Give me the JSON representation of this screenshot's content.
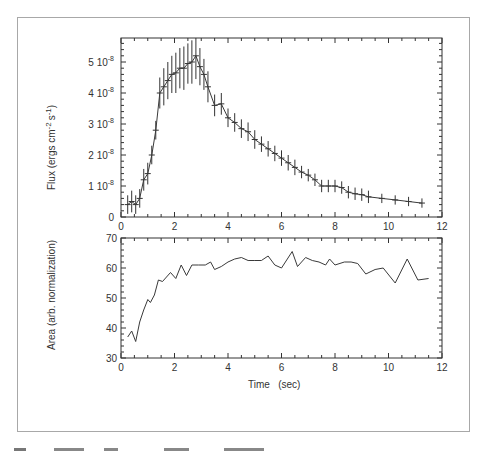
{
  "chart_data": [
    {
      "type": "line",
      "title": "",
      "xlabel": "",
      "ylabel": "Flux (ergs cm^-2 s^-1)",
      "xlim": [
        0,
        12
      ],
      "ylim": [
        0,
        5.77e-08
      ],
      "x_ticks": [
        "0",
        "2",
        "4",
        "6",
        "8",
        "10",
        "12"
      ],
      "y_ticks": [
        "0",
        "1 10^-8",
        "2 10^-8",
        "3 10^-8",
        "4 10^-8",
        "5 10^-8"
      ],
      "grid": false,
      "error_bars": true,
      "series": [
        {
          "name": "Flux",
          "x": [
            0.25,
            0.4,
            0.55,
            0.7,
            0.85,
            1.0,
            1.15,
            1.3,
            1.45,
            1.6,
            1.75,
            1.9,
            2.05,
            2.2,
            2.35,
            2.5,
            2.65,
            2.8,
            2.95,
            3.1,
            3.25,
            3.5,
            3.75,
            4.0,
            4.25,
            4.5,
            4.75,
            5.0,
            5.25,
            5.5,
            5.75,
            6.0,
            6.25,
            6.5,
            6.75,
            7.0,
            7.25,
            7.5,
            7.75,
            8.0,
            8.25,
            8.5,
            8.75,
            9.0,
            9.25,
            9.75,
            10.25,
            10.75,
            11.25
          ],
          "values_e8": [
            0.4,
            0.5,
            0.4,
            0.6,
            1.2,
            1.4,
            2.0,
            2.8,
            4.0,
            4.2,
            4.4,
            4.6,
            4.65,
            4.8,
            4.8,
            4.95,
            5.0,
            5.2,
            4.85,
            4.6,
            4.2,
            3.6,
            3.65,
            3.2,
            3.05,
            2.85,
            2.75,
            2.5,
            2.35,
            2.2,
            2.05,
            1.9,
            1.75,
            1.6,
            1.45,
            1.35,
            1.2,
            1.0,
            1.0,
            1.0,
            0.95,
            0.8,
            0.75,
            0.72,
            0.65,
            0.6,
            0.55,
            0.5,
            0.45
          ],
          "errors_e8": [
            0.3,
            0.35,
            0.3,
            0.3,
            0.35,
            0.35,
            0.3,
            0.3,
            0.5,
            0.6,
            0.6,
            0.6,
            0.65,
            0.65,
            0.7,
            0.65,
            0.7,
            0.75,
            0.6,
            0.5,
            0.5,
            0.35,
            0.35,
            0.3,
            0.3,
            0.3,
            0.3,
            0.3,
            0.25,
            0.25,
            0.25,
            0.25,
            0.25,
            0.25,
            0.2,
            0.2,
            0.2,
            0.2,
            0.2,
            0.2,
            0.2,
            0.2,
            0.2,
            0.2,
            0.2,
            0.15,
            0.15,
            0.15,
            0.15
          ]
        }
      ]
    },
    {
      "type": "line",
      "title": "",
      "xlabel": "Time (sec)",
      "ylabel": "Area (arb. normalization)",
      "xlim": [
        0,
        12
      ],
      "ylim": [
        30,
        70
      ],
      "x_ticks": [
        "0",
        "2",
        "4",
        "6",
        "8",
        "10",
        "12"
      ],
      "y_ticks": [
        "30",
        "40",
        "50",
        "60",
        "70"
      ],
      "grid": false,
      "series": [
        {
          "name": "Area",
          "x": [
            0.25,
            0.4,
            0.55,
            0.7,
            0.85,
            1.0,
            1.1,
            1.25,
            1.4,
            1.55,
            1.85,
            2.05,
            2.25,
            2.45,
            2.65,
            2.9,
            3.15,
            3.35,
            3.5,
            3.75,
            4.0,
            4.25,
            4.5,
            4.75,
            5.0,
            5.25,
            5.5,
            5.75,
            6.0,
            6.4,
            6.6,
            6.9,
            7.15,
            7.4,
            7.65,
            7.8,
            8.0,
            8.35,
            8.6,
            8.85,
            9.15,
            9.5,
            9.8,
            10.25,
            10.7,
            11.1,
            11.5
          ],
          "values": [
            37,
            39,
            35.5,
            42,
            46,
            49.5,
            48.5,
            51,
            56,
            55.5,
            58.5,
            56.5,
            61,
            57.5,
            61,
            61,
            61,
            62,
            59.5,
            60.5,
            62,
            63,
            63.5,
            62.5,
            62.5,
            62.5,
            64,
            61,
            60,
            65.5,
            60.5,
            63.5,
            62.5,
            62,
            61,
            63,
            61,
            62,
            62,
            61.5,
            58,
            59.5,
            60,
            55,
            63,
            56,
            56.5
          ]
        }
      ]
    }
  ],
  "top_panel": {
    "ylabel_main": "Flux  (ergs cm",
    "ylabel_sup1": "-2",
    "ylabel_mid": "s",
    "ylabel_sup2": "-1",
    "ylabel_end": ")",
    "y_tick_labels": [
      {
        "mant": "0",
        "exp": ""
      },
      {
        "mant": "1 10",
        "exp": "-8"
      },
      {
        "mant": "2 10",
        "exp": "-8"
      },
      {
        "mant": "3 10",
        "exp": "-8"
      },
      {
        "mant": "4 10",
        "exp": "-8"
      },
      {
        "mant": "5 10",
        "exp": "-8"
      }
    ],
    "x_tick_labels": [
      "0",
      "2",
      "4",
      "6",
      "8",
      "10",
      "12"
    ]
  },
  "bottom_panel": {
    "ylabel": "Area  (arb. normalization)",
    "xlabel": "Time   (sec)",
    "y_tick_labels": [
      "30",
      "40",
      "50",
      "60",
      "70"
    ],
    "x_tick_labels": [
      "0",
      "2",
      "4",
      "6",
      "8",
      "10",
      "12"
    ]
  },
  "colors": {
    "line": "#3a3a3a",
    "axis": "#333333",
    "frame": "#a8a8a8"
  }
}
